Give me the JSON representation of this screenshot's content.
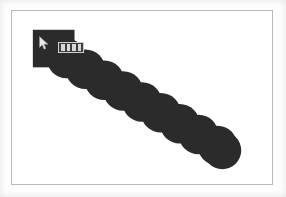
{
  "app": {
    "title": "Paint Drag Trail",
    "window_background": "#ffffff",
    "canvas_background": "#ffffff",
    "canvas_border_color": "#b9b9b9"
  },
  "canvas": {
    "name": "drawing-canvas",
    "width": 262,
    "height": 175,
    "offset_x": 11,
    "offset_y": 10
  },
  "drawing": {
    "ink_color": "#2b2b2b",
    "description": "Dark brush trail descending from upper-left to lower-right",
    "start_square": {
      "x": 21,
      "y": 19,
      "width": 42,
      "height": 38
    },
    "blobs": [
      {
        "cx": 55,
        "cy": 48,
        "r": 20
      },
      {
        "cx": 74,
        "cy": 59,
        "r": 20
      },
      {
        "cx": 93,
        "cy": 70,
        "r": 20
      },
      {
        "cx": 112,
        "cy": 81,
        "r": 20
      },
      {
        "cx": 131,
        "cy": 92,
        "r": 20
      },
      {
        "cx": 150,
        "cy": 103,
        "r": 20
      },
      {
        "cx": 169,
        "cy": 114,
        "r": 20
      },
      {
        "cx": 188,
        "cy": 125,
        "r": 20
      },
      {
        "cx": 207,
        "cy": 136,
        "r": 20
      }
    ],
    "end_dot": {
      "cx": 212,
      "cy": 141,
      "r": 19
    }
  },
  "cursor": {
    "name": "mouse-pointer",
    "icon": "cursor-arrow-icon",
    "x": 27,
    "y": 25,
    "color": "#efefef"
  },
  "toolbar_widget": {
    "name": "floating-toolbar",
    "icon": "grid-cells-icon",
    "x": 46,
    "y": 31,
    "width": 26,
    "height": 11,
    "cell_count": 4,
    "frame_color": "#cfcfcf",
    "cell_color": "#d8d8d8",
    "body_color": "#3c3c3c"
  }
}
